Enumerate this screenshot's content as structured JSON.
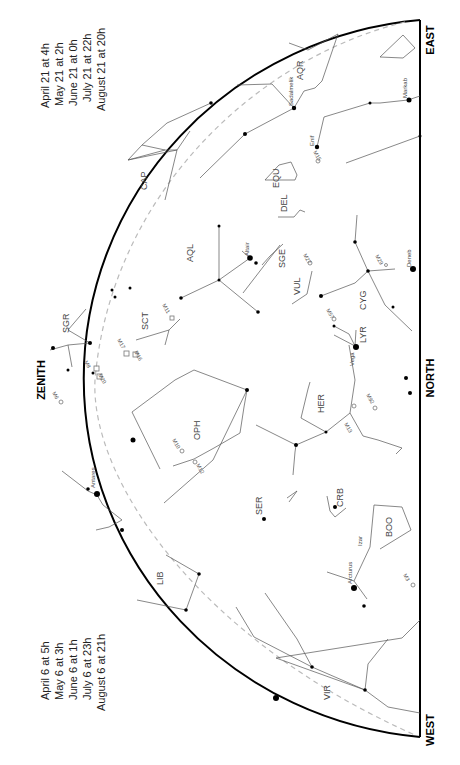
{
  "chart": {
    "directions": {
      "top_left": "ZENITH",
      "top_right": "EAST",
      "bottom_right": "WEST",
      "middle_right": "NORTH",
      "zenith": "ZENITH",
      "east": "EAST",
      "west": "WEST",
      "north": "NORTH"
    },
    "times_east": [
      "April 21 at  4h",
      "May 21 at  2h",
      "June 21 at  0h",
      "July 21 at 22h",
      "August 21 at 20h"
    ],
    "times_west": [
      "April 6 at  5h",
      "May 6 at  3h",
      "June 6 at  1h",
      "July 6 at 23h",
      "August 6 at 21h"
    ],
    "constellations": [
      "AQR",
      "CAP",
      "EQU",
      "DEL",
      "AQL",
      "SGE",
      "VUL",
      "CYG",
      "LYR",
      "SCT",
      "SGR",
      "OPH",
      "HER",
      "SER",
      "CRB",
      "BOO",
      "LIB",
      "VIR",
      "SCO"
    ],
    "stars": [
      "Sadalmelik",
      "Markab",
      "Enif",
      "Altair",
      "Deneb",
      "Vega",
      "Antares",
      "Izar",
      "Arcturus"
    ],
    "deep_sky": [
      "M15",
      "M27",
      "M57",
      "M29",
      "M11",
      "M17",
      "M16",
      "M20",
      "M8",
      "M6",
      "M10",
      "M12",
      "M13",
      "M92",
      "M3"
    ],
    "colors": {
      "horizon": "#000000",
      "lines": "#555555",
      "ecliptic": "#bbbbbb"
    }
  }
}
